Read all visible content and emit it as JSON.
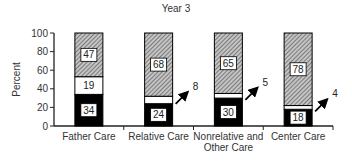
{
  "chart_data": {
    "type": "bar",
    "stacked": true,
    "title": "Year 3",
    "xlabel": "",
    "ylabel": "Percent",
    "ylim": [
      0,
      100
    ],
    "yticks": [
      0,
      20,
      40,
      60,
      80,
      100
    ],
    "categories": [
      "Father Care",
      "Relative Care",
      "Nonrelative and Other Care",
      "Center Care"
    ],
    "category_label_lines": [
      [
        "Father Care"
      ],
      [
        "Relative Care"
      ],
      [
        "Nonrelative and",
        "Other Care"
      ],
      [
        "Center Care"
      ]
    ],
    "series": [
      {
        "name": "bottom (solid black)",
        "fill": "#000000",
        "values": [
          34,
          24,
          30,
          18
        ]
      },
      {
        "name": "middle (white)",
        "fill": "#ffffff",
        "values": [
          19,
          8,
          5,
          4
        ]
      },
      {
        "name": "top (hatched)",
        "fill": "hatch",
        "values": [
          47,
          68,
          65,
          78
        ]
      }
    ],
    "annotations": [
      {
        "category": "Relative Care",
        "series": "middle (white)",
        "label": "8",
        "style": "arrow"
      },
      {
        "category": "Nonrelative and Other Care",
        "series": "middle (white)",
        "label": "5",
        "style": "arrow"
      },
      {
        "category": "Center Care",
        "series": "middle (white)",
        "label": "4",
        "style": "arrow"
      }
    ],
    "grid": false,
    "legend": "none"
  },
  "colors": {
    "axis": "#222222",
    "solid": "#000000",
    "hatch_bg": "#bdbdbd",
    "hatch_line": "#555555",
    "label_box": "#ffffff"
  }
}
